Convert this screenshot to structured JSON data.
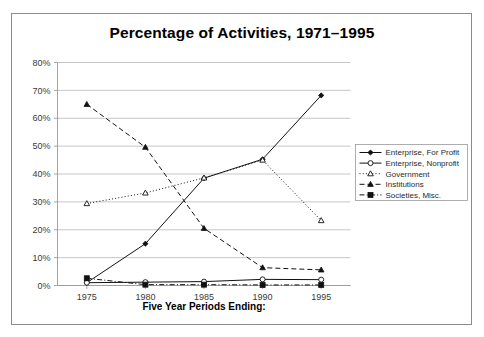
{
  "chart_data": {
    "type": "line",
    "title": "Percentage of Activities, 1971–1995",
    "xlabel": "Five Year Periods Ending:",
    "ylabel": "",
    "categories": [
      "1975",
      "1980",
      "1985",
      "1990",
      "1995"
    ],
    "x": [
      1975,
      1980,
      1985,
      1990,
      1995
    ],
    "ylim": [
      0,
      80
    ],
    "yticks": [
      0,
      10,
      20,
      30,
      40,
      50,
      60,
      70,
      80
    ],
    "ytick_labels": [
      "0%",
      "10%",
      "20%",
      "30%",
      "40%",
      "50%",
      "60%",
      "70%",
      "80%"
    ],
    "xtick_labels": [
      "1975",
      "1980",
      "1985",
      "1990",
      "1995"
    ],
    "grid": "horizontal",
    "legend_position": "right",
    "series": [
      {
        "name": "Enterprise, For Profit",
        "values": [
          1.0,
          15.0,
          38.5,
          45.3,
          68.2
        ],
        "line_style": "solid",
        "marker": "diamond-filled",
        "color": "#111111"
      },
      {
        "name": "Enterprise, Nonprofit",
        "values": [
          1.0,
          1.2,
          1.4,
          2.2,
          2.1
        ],
        "line_style": "solid",
        "marker": "circle-open",
        "color": "#111111"
      },
      {
        "name": "Government",
        "values": [
          29.4,
          33.2,
          38.6,
          45.0,
          23.3
        ],
        "line_style": "dotted",
        "marker": "triangle-open",
        "color": "#111111"
      },
      {
        "name": "Institutions",
        "values": [
          65.0,
          49.6,
          20.5,
          6.4,
          5.6
        ],
        "line_style": "dashed",
        "marker": "triangle-filled",
        "color": "#111111"
      },
      {
        "name": "Societies, Misc.",
        "values": [
          2.6,
          0.3,
          0.3,
          0.2,
          0.2
        ],
        "line_style": "dash-dot",
        "marker": "square-filled",
        "color": "#111111"
      }
    ]
  },
  "figure": {
    "background_color": "#ffffff",
    "frame_color": "#8b8b8b",
    "grid_color": "#b9b9b9",
    "axis_color": "#9a9a9a",
    "ink_color": "#111111"
  }
}
